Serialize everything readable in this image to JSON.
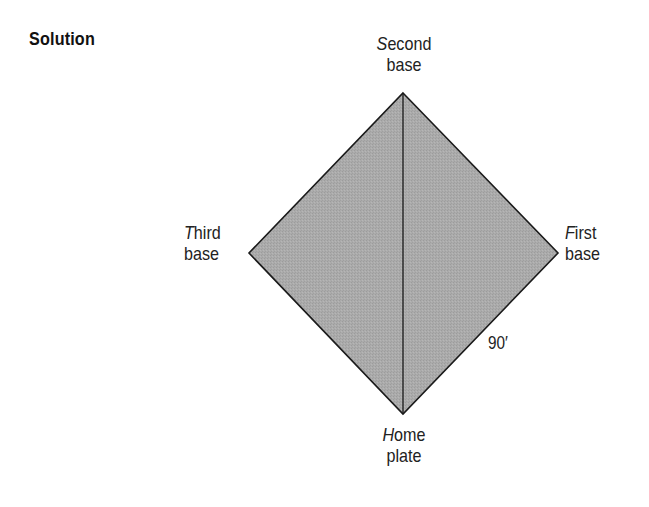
{
  "heading": "Solution",
  "diagram": {
    "shape": "diamond",
    "fill_color": "#a9a9a9",
    "stroke_color": "#1a1a1a",
    "vertices": {
      "second_base": {
        "x": 403,
        "y": 93
      },
      "first_base": {
        "x": 558,
        "y": 253
      },
      "home_plate": {
        "x": 403,
        "y": 414
      },
      "third_base": {
        "x": 249,
        "y": 253
      }
    },
    "diagonal": "home plate to second base",
    "labels": {
      "second_base": {
        "initial": "S",
        "rest": "econd",
        "line2": "base"
      },
      "third_base": {
        "initial": "T",
        "rest": "hird",
        "line2": "base"
      },
      "first_base": {
        "initial": "F",
        "rest": "irst",
        "line2": "base"
      },
      "home_plate": {
        "initial": "H",
        "rest": "ome",
        "line2": "plate"
      }
    },
    "side_length_label": "90′"
  }
}
